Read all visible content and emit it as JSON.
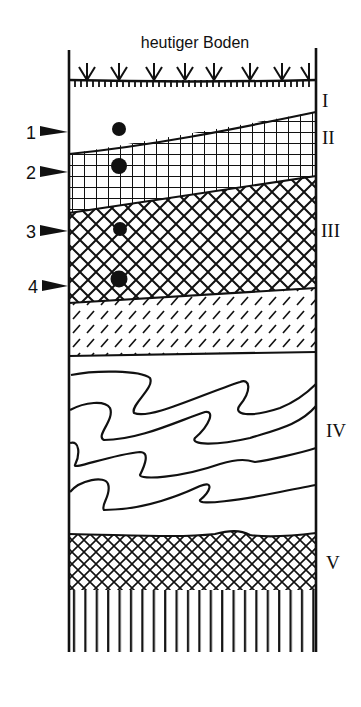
{
  "diagram": {
    "title": "heutiger Boden",
    "layers": [
      {
        "id": "I",
        "label": "I",
        "pattern": "blank"
      },
      {
        "id": "II",
        "label": "II",
        "pattern": "square-grid"
      },
      {
        "id": "III",
        "label": "III",
        "pattern": "diagonal-crosshatch"
      },
      {
        "id": "III-lower",
        "label": "",
        "pattern": "dashed-diagonal"
      },
      {
        "id": "IV",
        "label": "IV",
        "pattern": "wavy-lines"
      },
      {
        "id": "V",
        "label": "V",
        "pattern": "fine-crosshatch"
      },
      {
        "id": "base",
        "label": "",
        "pattern": "vertical-lines"
      }
    ],
    "markers": [
      {
        "number": "1"
      },
      {
        "number": "2"
      },
      {
        "number": "3"
      },
      {
        "number": "4"
      }
    ],
    "colors": {
      "ink": "#111111",
      "paper": "#ffffff"
    }
  }
}
